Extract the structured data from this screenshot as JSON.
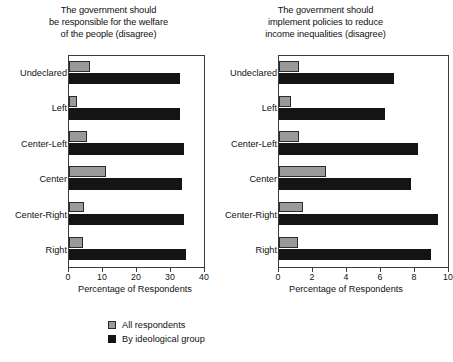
{
  "figure": {
    "legend": [
      {
        "key": "all",
        "label": "All respondents",
        "color": "#9a9a9a"
      },
      {
        "key": "ideological",
        "label": "By ideological group",
        "color": "#141414"
      }
    ]
  },
  "chart_data": [
    {
      "type": "bar",
      "orientation": "horizontal",
      "title": "The government should\nbe responsible for the welfare\nof the people (disagree)",
      "xlabel": "Percentage of Respondents",
      "ylabel": "",
      "categories": [
        "Undeclared",
        "Left",
        "Center-Left",
        "Center",
        "Center-Right",
        "Right"
      ],
      "series": [
        {
          "name": "All respondents",
          "color": "#9a9a9a",
          "values": [
            6.2,
            2.4,
            5.3,
            11.0,
            4.4,
            4.1
          ]
        },
        {
          "name": "By ideological group",
          "color": "#141414",
          "values": [
            33.0,
            33.0,
            34.0,
            33.5,
            34.0,
            34.7
          ]
        }
      ],
      "xlim": [
        0,
        40
      ],
      "xticks": [
        0,
        10,
        20,
        30,
        40
      ],
      "grid": false,
      "legend_position": "bottom"
    },
    {
      "type": "bar",
      "orientation": "horizontal",
      "title": "The government should\nimplement policies to reduce\nincome inequalities (disagree)",
      "xlabel": "Percentage of Respondents",
      "ylabel": "",
      "categories": [
        "Undeclared",
        "Left",
        "Center-Left",
        "Center",
        "Center-Right",
        "Right"
      ],
      "series": [
        {
          "name": "All respondents",
          "color": "#9a9a9a",
          "values": [
            1.2,
            0.7,
            1.2,
            2.8,
            1.4,
            1.1
          ]
        },
        {
          "name": "By ideological group",
          "color": "#141414",
          "values": [
            6.8,
            6.3,
            8.2,
            7.8,
            9.4,
            9.0
          ]
        }
      ],
      "xlim": [
        0,
        10
      ],
      "xticks": [
        0,
        2,
        4,
        6,
        8,
        10
      ],
      "grid": false,
      "legend_position": "bottom"
    }
  ]
}
